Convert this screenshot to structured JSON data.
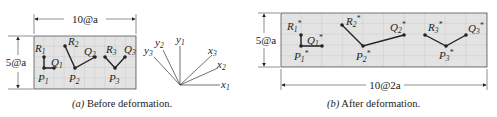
{
  "panel_a": {
    "caption_prefix": "(a)",
    "caption_text": " Before deformation.",
    "width_dim": "10@a",
    "height_dim": "5@a",
    "points": {
      "R1": "R",
      "Q1": "Q",
      "P1": "P",
      "R2": "R",
      "Q2": "Q",
      "P2": "P",
      "R3": "R",
      "Q3": "Q",
      "P3": "P"
    }
  },
  "axes": {
    "x1": "x",
    "x2": "x",
    "x3": "x",
    "y1": "y",
    "y2": "y",
    "y3": "y"
  },
  "panel_b": {
    "caption_prefix": "(b)",
    "caption_text": " After deformation.",
    "width_dim": "10@2a",
    "height_dim": "5@a",
    "star": "*"
  },
  "subscripts": {
    "one": "1",
    "two": "2",
    "three": "3"
  },
  "colors": {
    "grid_fill": "#e3e3e3",
    "grid_line": "#b8b8b8",
    "ink": "#222222"
  }
}
